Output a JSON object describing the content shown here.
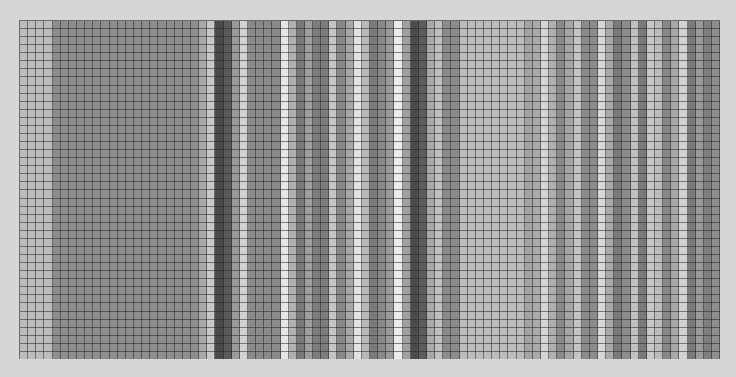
{
  "grid": {
    "columns": 86,
    "rows": 42,
    "background": "#d6d6d6",
    "line_color": "#3a3a3a",
    "column_shades": [
      "#bcbcbc",
      "#bcbcbc",
      "#bcbcbc",
      "#bcbcbc",
      "#8e8e8e",
      "#8e8e8e",
      "#8e8e8e",
      "#8e8e8e",
      "#8e8e8e",
      "#8e8e8e",
      "#8e8e8e",
      "#8e8e8e",
      "#8e8e8e",
      "#8e8e8e",
      "#8e8e8e",
      "#8e8e8e",
      "#8e8e8e",
      "#8e8e8e",
      "#8e8e8e",
      "#8e8e8e",
      "#8e8e8e",
      "#8e8e8e",
      "#a8a8a8",
      "#c8c8c8",
      "#4a4a4a",
      "#5a5a5a",
      "#9a9a9a",
      "#d2d2d2",
      "#8a8a8a",
      "#8a8a8a",
      "#8a8a8a",
      "#8a8a8a",
      "#e6e6e6",
      "#b0b0b0",
      "#7a7a7a",
      "#9e9e9e",
      "#7c7c7c",
      "#7c7c7c",
      "#c4c4c4",
      "#888888",
      "#a8a8a8",
      "#e2e2e2",
      "#b8b8b8",
      "#7a7a7a",
      "#888888",
      "#9a9a9a",
      "#ececec",
      "#a0a0a0",
      "#4c4c4c",
      "#5c5c5c",
      "#a8a8a8",
      "#c0c0c0",
      "#8c8c8c",
      "#8c8c8c",
      "#bcbcbc",
      "#bcbcbc",
      "#bcbcbc",
      "#bcbcbc",
      "#bcbcbc",
      "#bcbcbc",
      "#bcbcbc",
      "#bcbcbc",
      "#a4a4a4",
      "#aaaaaa",
      "#d4d4d4",
      "#b0b0b0",
      "#8a8a8a",
      "#a6a6a6",
      "#c4c4c4",
      "#8c8c8c",
      "#8c8c8c",
      "#d8d8d8",
      "#aaaaaa",
      "#7a7a7a",
      "#8c8c8c",
      "#c0c0c0",
      "#7a7a7a",
      "#c8c8c8",
      "#bcbcbc",
      "#888888",
      "#a8a8a8",
      "#d2d2d2",
      "#7a7a7a",
      "#9a9a9a",
      "#7e7e7e",
      "#8e8e8e"
    ]
  }
}
